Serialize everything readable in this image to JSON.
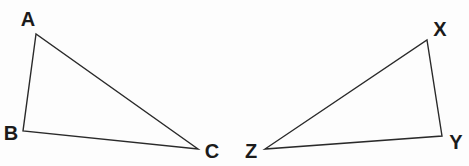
{
  "figure": {
    "kind": "geometry-diagram",
    "canvas": {
      "width": 469,
      "height": 166
    },
    "background_color": "#fdfdfd",
    "stroke_color": "#2a2a2a",
    "stroke_width": 1.4,
    "label_color": "#1b1b1b",
    "shapes": [
      {
        "name": "triangle-abc",
        "vertices": [
          {
            "label": "A",
            "x": 36,
            "y": 34,
            "label_x": 28,
            "label_y": 19
          },
          {
            "label": "B",
            "x": 23,
            "y": 131,
            "label_x": 11,
            "label_y": 133
          },
          {
            "label": "C",
            "x": 198,
            "y": 149,
            "label_x": 212,
            "label_y": 151
          }
        ],
        "edges": [
          "A-B",
          "A-C",
          "B-C"
        ]
      },
      {
        "name": "triangle-xyz",
        "vertices": [
          {
            "label": "X",
            "x": 427,
            "y": 40,
            "label_x": 440,
            "label_y": 29
          },
          {
            "label": "Y",
            "x": 442,
            "y": 136,
            "label_x": 456,
            "label_y": 142
          },
          {
            "label": "Z",
            "x": 265,
            "y": 149,
            "label_x": 251,
            "label_y": 151
          }
        ],
        "edges": [
          "X-Y",
          "X-Z",
          "Y-Z"
        ]
      }
    ]
  }
}
